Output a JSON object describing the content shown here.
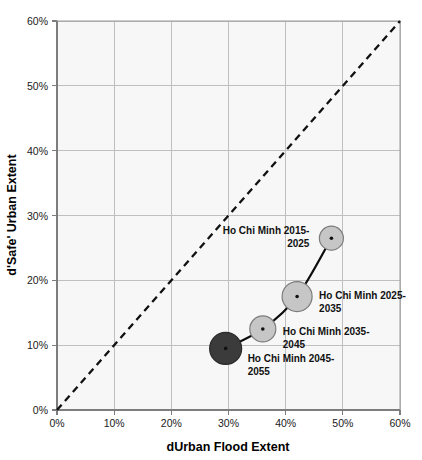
{
  "chart_data": {
    "type": "scatter",
    "title": "",
    "xlabel": "dUrban Flood Extent",
    "ylabel": "d'Safe' Urban Extent",
    "xlim": [
      0,
      60
    ],
    "ylim": [
      0,
      60
    ],
    "grid": true,
    "legend_position": "none",
    "x_tick_labels": [
      "0%",
      "10%",
      "20%",
      "30%",
      "40%",
      "50%",
      "60%"
    ],
    "y_tick_labels": [
      "0%",
      "10%",
      "20%",
      "30%",
      "40%",
      "50%",
      "60%"
    ],
    "x_ticks": [
      0,
      10,
      20,
      30,
      40,
      50,
      60
    ],
    "y_ticks": [
      0,
      10,
      20,
      30,
      40,
      50,
      60
    ],
    "series": [
      {
        "name": "Ho Chi Minh",
        "connected": true,
        "points": [
          {
            "label": "Ho Chi Minh 2015-2025",
            "label_line1": "Ho Chi Minh 2015-",
            "label_line2": "2025",
            "x": 48,
            "y": 26.5,
            "size": 12,
            "color": "#c6c6c6"
          },
          {
            "label": "Ho Chi Minh 2025-2035",
            "label_line1": "Ho Chi Minh 2025-",
            "label_line2": "2035",
            "x": 42,
            "y": 17.5,
            "size": 15,
            "color": "#c6c6c6"
          },
          {
            "label": "Ho Chi Minh 2035-2045",
            "label_line1": "Ho Chi Minh 2035-",
            "label_line2": "2045",
            "x": 36,
            "y": 12.5,
            "size": 13,
            "color": "#c6c6c6"
          },
          {
            "label": "Ho Chi Minh 2045-2055",
            "label_line1": "Ho Chi Minh 2045-",
            "label_line2": "2055",
            "x": 29.5,
            "y": 9.5,
            "size": 16,
            "color": "#3b3b3b"
          }
        ]
      }
    ],
    "reference_line": {
      "name": "one-to-one-line",
      "style": "dashed",
      "from": [
        0,
        0
      ],
      "to": [
        60,
        60
      ]
    }
  }
}
